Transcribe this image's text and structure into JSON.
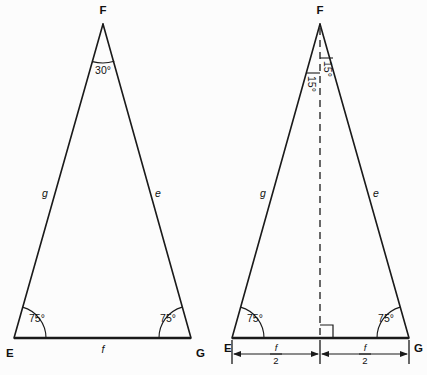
{
  "figure": {
    "background_color": "#fcfcfc",
    "line_color": "#1a1a1a",
    "text_color": "#111111"
  },
  "triangles": [
    {
      "id": "triangle-left",
      "vertices": {
        "apex": "F",
        "bottom_left": "E",
        "bottom_right": "G"
      },
      "angles": {
        "apex": "30°",
        "bottom_left": "75°",
        "bottom_right": "75°"
      },
      "sides": {
        "left": "g",
        "right": "e",
        "base": "f"
      }
    },
    {
      "id": "triangle-right",
      "vertices": {
        "apex": "F",
        "bottom_left": "E",
        "bottom_right": "G"
      },
      "angles": {
        "apex_left": "15°",
        "apex_right": "15°",
        "bottom_left": "75°",
        "bottom_right": "75°"
      },
      "sides": {
        "left": "g",
        "right": "e"
      },
      "altitude": {
        "style": "dashed",
        "right_angle_marker": true
      },
      "dimensions": [
        {
          "numerator": "f",
          "denominator": "2"
        },
        {
          "numerator": "f",
          "denominator": "2"
        }
      ]
    }
  ]
}
